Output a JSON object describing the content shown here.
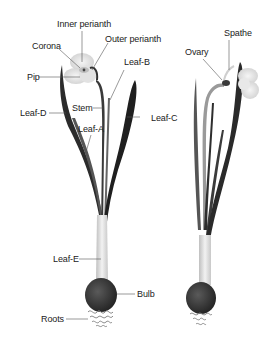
{
  "figure": {
    "colors": {
      "background": "#ffffff",
      "leaf_dark": "#2a2a2a",
      "leaf_mid": "#6a6a6a",
      "stem_pale": "#d8d8d8",
      "bulb": "#3a3a3a",
      "flower": "#e6e6e6",
      "leader_line": "#555555",
      "label_text": "#222222"
    }
  },
  "labels": {
    "inner_perianth": "Inner perianth",
    "corona": "Corona",
    "outer_perianth": "Outer perianth",
    "pip": "Pip",
    "leaf_b": "Leaf-B",
    "leaf_d": "Leaf-D",
    "stem": "Stem",
    "leaf_c": "Leaf-C",
    "leaf_a": "Leaf-A",
    "leaf_e": "Leaf-E",
    "bulb": "Bulb",
    "roots": "Roots",
    "spathe": "Spathe",
    "ovary": "Ovary"
  }
}
